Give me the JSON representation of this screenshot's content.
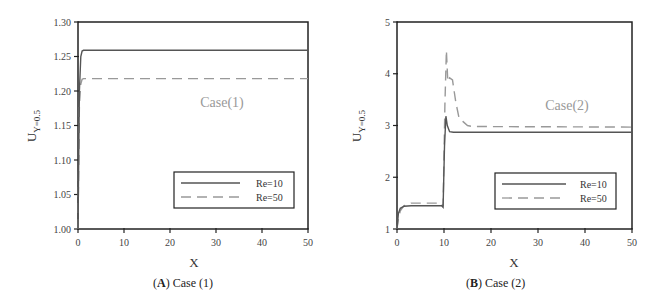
{
  "chart_data": [
    {
      "type": "line",
      "panel": "A",
      "caption_letter": "A",
      "caption_text": "Case (1)",
      "annotation": "Case(1)",
      "xlabel": "X",
      "ylabel": "U",
      "ylabel_sub": "Y=0.5",
      "xlim": [
        0,
        50
      ],
      "ylim": [
        1.0,
        1.3
      ],
      "xticks": [
        "0",
        "10",
        "20",
        "30",
        "40",
        "50"
      ],
      "yticks": [
        "1.00",
        "1.05",
        "1.10",
        "1.15",
        "1.20",
        "1.25",
        "1.30"
      ],
      "grid": false,
      "legend_position": "lower right",
      "series": [
        {
          "name": "Re=10",
          "style": "solid",
          "color": "#555555",
          "x": [
            0,
            0.3,
            0.6,
            0.9,
            1.2,
            50
          ],
          "y": [
            1.0,
            1.2,
            1.25,
            1.258,
            1.259,
            1.259
          ]
        },
        {
          "name": "Re=50",
          "style": "dashed",
          "color": "#999999",
          "x": [
            0,
            0.3,
            0.6,
            0.9,
            1.2,
            50
          ],
          "y": [
            1.0,
            1.18,
            1.21,
            1.217,
            1.218,
            1.218
          ]
        }
      ]
    },
    {
      "type": "line",
      "panel": "B",
      "caption_letter": "B",
      "caption_text": "Case (2)",
      "annotation": "Case(2)",
      "xlabel": "X",
      "ylabel": "U",
      "ylabel_sub": "Y=0.5",
      "xlim": [
        0,
        50
      ],
      "ylim": [
        1,
        5
      ],
      "xticks": [
        "0",
        "10",
        "20",
        "30",
        "40",
        "50"
      ],
      "yticks": [
        "1",
        "2",
        "3",
        "4",
        "5"
      ],
      "grid": false,
      "legend_position": "lower right",
      "series": [
        {
          "name": "Re=10",
          "style": "solid",
          "color": "#555555",
          "x": [
            0,
            0.3,
            0.7,
            1.5,
            3,
            9.5,
            9.8,
            10.1,
            10.4,
            10.7,
            11.2,
            12,
            50
          ],
          "y": [
            1.0,
            1.3,
            1.4,
            1.44,
            1.45,
            1.45,
            1.42,
            2.6,
            3.18,
            3.0,
            2.88,
            2.87,
            2.87
          ]
        },
        {
          "name": "Re=50",
          "style": "dashed",
          "color": "#999999",
          "x": [
            0,
            0.3,
            0.7,
            1.5,
            3,
            9.5,
            9.8,
            10.2,
            10.5,
            10.8,
            11.2,
            11.8,
            12.5,
            13.2,
            14,
            15,
            16,
            50
          ],
          "y": [
            1.0,
            1.2,
            1.35,
            1.45,
            1.5,
            1.5,
            1.44,
            3.4,
            4.45,
            3.85,
            3.92,
            3.88,
            3.45,
            3.15,
            3.08,
            3.0,
            2.98,
            2.97
          ]
        }
      ]
    }
  ]
}
